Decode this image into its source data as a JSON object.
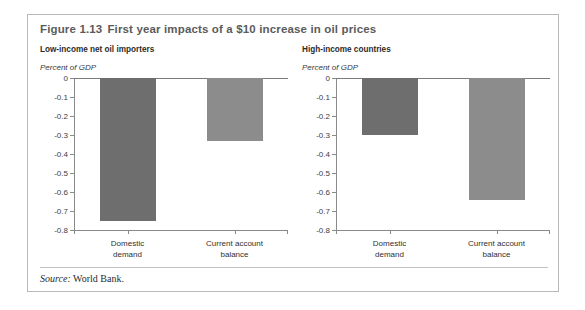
{
  "figure": {
    "number": "Figure 1.13",
    "title": "First year impacts of a $10 increase in oil prices",
    "source_label": "Source:",
    "source_text": "World Bank."
  },
  "colors": {
    "domestic_demand": "#6e6e6e",
    "current_account": "#8c8c8c",
    "axis": "#8a8a8a",
    "title": "#5b5b5b",
    "border": "#b9b9b9"
  },
  "axis": {
    "ticks": [
      "0",
      "-0.1",
      "-0.2",
      "-0.3",
      "-0.4",
      "-0.5",
      "-0.6",
      "-0.7",
      "-0.8"
    ],
    "categories": [
      "Domestic demand",
      "Current account balance"
    ],
    "category_lines": [
      [
        "Domestic",
        "demand"
      ],
      [
        "Current account",
        "balance"
      ]
    ]
  },
  "chart_data": [
    {
      "type": "bar",
      "title": "Low-income net oil importers",
      "ylabel": "Percent of GDP",
      "xlabel": "",
      "categories": [
        "Domestic demand",
        "Current account balance"
      ],
      "values": [
        -0.75,
        -0.33
      ],
      "ylim": [
        -0.8,
        0
      ],
      "ytick_step": 0.1,
      "grid": false,
      "legend": "none",
      "series": [
        {
          "name": "Low-income net oil importers",
          "values": [
            -0.75,
            -0.33
          ]
        }
      ]
    },
    {
      "type": "bar",
      "title": "High-income countries",
      "ylabel": "Percent of GDP",
      "xlabel": "",
      "categories": [
        "Domestic demand",
        "Current account balance"
      ],
      "values": [
        -0.3,
        -0.64
      ],
      "ylim": [
        -0.8,
        0
      ],
      "ytick_step": 0.1,
      "grid": false,
      "legend": "none",
      "series": [
        {
          "name": "High-income countries",
          "values": [
            -0.3,
            -0.64
          ]
        }
      ]
    }
  ]
}
